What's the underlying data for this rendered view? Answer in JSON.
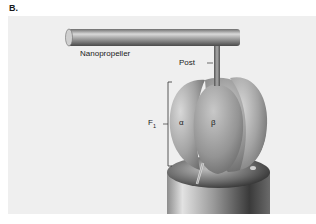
{
  "figure": {
    "panel_label": "B.",
    "labels": {
      "nanopropeller": "Nanopropeller",
      "post": "Post",
      "f1_main": "F",
      "f1_sub": "1",
      "alpha": "α",
      "beta": "β"
    },
    "colors": {
      "background_panel": "#efefef",
      "subunit_fill": "#9a9a9a",
      "cylinder_dark": "#3c3c3c",
      "rod": "#8a8a8a"
    }
  }
}
